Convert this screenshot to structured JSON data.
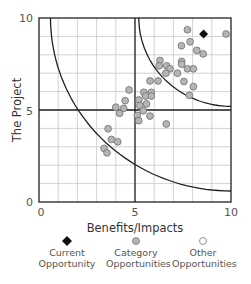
{
  "chart_data": {
    "type": "scatter",
    "title": "",
    "xlabel": "Benefits/Impacts",
    "ylabel": "The Project",
    "xlim": [
      0,
      10
    ],
    "ylim": [
      0,
      10
    ],
    "x_ticks": [
      "0",
      "5",
      "10"
    ],
    "y_ticks": [
      "0",
      "5",
      "10"
    ],
    "grid": true,
    "quadrant_lines": {
      "x": 5,
      "y": 5
    },
    "curves": [
      {
        "name": "inner-arc",
        "center": [
          10,
          10
        ],
        "radius": 9.4
      },
      {
        "name": "outer-arc",
        "center": [
          10,
          10
        ],
        "radius": 4.8
      }
    ],
    "legend_position": "bottom",
    "series": [
      {
        "name": "Current Opportunity",
        "marker": "diamond",
        "color": "#111111",
        "points": [
          [
            8.57,
            9.13
          ]
        ]
      },
      {
        "name": "Category Opportunities",
        "marker": "circle",
        "color": "#b5b5b5",
        "points": [
          [
            7.73,
            9.36
          ],
          [
            9.74,
            9.13
          ],
          [
            7.42,
            8.49
          ],
          [
            7.87,
            8.71
          ],
          [
            8.22,
            8.24
          ],
          [
            8.55,
            8.05
          ],
          [
            6.3,
            7.69
          ],
          [
            7.43,
            7.64
          ],
          [
            7.43,
            7.49
          ],
          [
            6.26,
            7.4
          ],
          [
            6.65,
            7.4
          ],
          [
            6.82,
            7.24
          ],
          [
            6.61,
            7.0
          ],
          [
            7.21,
            7.0
          ],
          [
            7.73,
            7.24
          ],
          [
            8.04,
            7.24
          ],
          [
            5.78,
            6.58
          ],
          [
            6.2,
            6.58
          ],
          [
            7.55,
            6.55
          ],
          [
            8.04,
            6.27
          ],
          [
            7.83,
            5.8
          ],
          [
            4.69,
            6.09
          ],
          [
            5.46,
            5.96
          ],
          [
            5.85,
            5.96
          ],
          [
            5.56,
            5.76
          ],
          [
            5.85,
            5.76
          ],
          [
            4.49,
            5.51
          ],
          [
            5.2,
            5.55
          ],
          [
            4.0,
            5.15
          ],
          [
            4.41,
            5.09
          ],
          [
            4.2,
            4.82
          ],
          [
            5.25,
            5.24
          ],
          [
            5.6,
            5.33
          ],
          [
            5.43,
            4.96
          ],
          [
            5.12,
            4.71
          ],
          [
            5.19,
            4.42
          ],
          [
            5.78,
            4.67
          ],
          [
            6.63,
            4.24
          ],
          [
            3.6,
            3.98
          ],
          [
            3.77,
            3.4
          ],
          [
            4.1,
            3.27
          ],
          [
            3.39,
            2.91
          ],
          [
            3.54,
            2.67
          ]
        ]
      },
      {
        "name": "Other Opportunities",
        "marker": "circle-open",
        "color": "#ffffff",
        "points": []
      }
    ]
  },
  "legend": {
    "items": [
      {
        "line1": "Current",
        "line2": "Opportunity"
      },
      {
        "line1": "Category",
        "line2": "Opportunities"
      },
      {
        "line1": "Other",
        "line2": "Opportunities"
      }
    ]
  },
  "axes": {
    "xlabel": "Benefits/Impacts",
    "ylabel": "The Project",
    "x0": "0",
    "x5": "5",
    "x10": "10",
    "y0": "0",
    "y5": "5",
    "y10": "10"
  }
}
